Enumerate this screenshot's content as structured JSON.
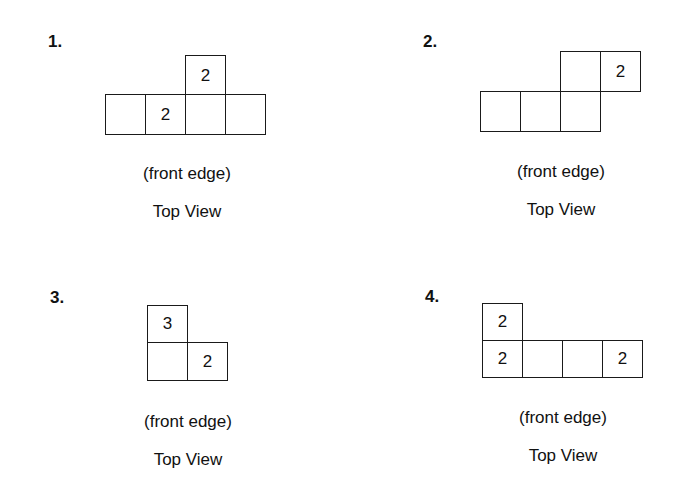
{
  "problems": [
    {
      "label": "1.",
      "caption_edge": "(front edge)",
      "caption_view": "Top View",
      "cells": [
        {
          "row": 0,
          "col": 2,
          "value": "2"
        },
        {
          "row": 1,
          "col": 0,
          "value": ""
        },
        {
          "row": 1,
          "col": 1,
          "value": "2"
        },
        {
          "row": 1,
          "col": 2,
          "value": ""
        },
        {
          "row": 1,
          "col": 3,
          "value": ""
        }
      ]
    },
    {
      "label": "2.",
      "caption_edge": "(front edge)",
      "caption_view": "Top View",
      "cells": [
        {
          "row": 0,
          "col": 2,
          "value": ""
        },
        {
          "row": 0,
          "col": 3,
          "value": "2"
        },
        {
          "row": 1,
          "col": 0,
          "value": ""
        },
        {
          "row": 1,
          "col": 1,
          "value": ""
        },
        {
          "row": 1,
          "col": 2,
          "value": ""
        }
      ]
    },
    {
      "label": "3.",
      "caption_edge": "(front edge)",
      "caption_view": "Top View",
      "cells": [
        {
          "row": 0,
          "col": 0,
          "value": "3"
        },
        {
          "row": 1,
          "col": 0,
          "value": ""
        },
        {
          "row": 1,
          "col": 1,
          "value": "2"
        }
      ]
    },
    {
      "label": "4.",
      "caption_edge": "(front edge)",
      "caption_view": "Top View",
      "cells": [
        {
          "row": 0,
          "col": 0,
          "value": "2"
        },
        {
          "row": 1,
          "col": 0,
          "value": "2"
        },
        {
          "row": 1,
          "col": 1,
          "value": ""
        },
        {
          "row": 1,
          "col": 2,
          "value": ""
        },
        {
          "row": 1,
          "col": 3,
          "value": "2"
        }
      ]
    }
  ]
}
